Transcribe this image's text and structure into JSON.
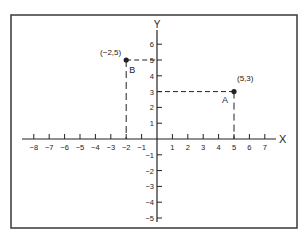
{
  "figure": {
    "axis_labels": {
      "x": "X",
      "y": "Y"
    },
    "x_ticks": [
      -8,
      -7,
      -6,
      -5,
      -4,
      -3,
      -2,
      -1,
      1,
      2,
      3,
      4,
      5,
      6,
      7
    ],
    "y_ticks": [
      6,
      5,
      4,
      3,
      2,
      1,
      -1,
      -2,
      -3,
      -4,
      -5
    ],
    "points": [
      {
        "name": "A",
        "x": 5,
        "y": 3,
        "coord_label": "(5,3)"
      },
      {
        "name": "B",
        "x": -2,
        "y": 5,
        "coord_label": "(−2,5)"
      }
    ],
    "colors": {
      "ink": "#222222",
      "frame": "#444444",
      "background": "#ffffff"
    }
  },
  "chart_data": {
    "type": "scatter",
    "title": "",
    "xlabel": "X",
    "ylabel": "Y",
    "xlim": [
      -8,
      7
    ],
    "ylim": [
      -5,
      6
    ],
    "grid": false,
    "series": [
      {
        "name": "points",
        "x": [
          5,
          -2
        ],
        "y": [
          3,
          5
        ],
        "labels": [
          "A (5,3)",
          "B (-2,5)"
        ]
      }
    ],
    "annotations": [
      "Dashed projection lines from A to x=5 on X axis and y=3 on Y axis",
      "Dashed projection lines from B to x=-2 on X axis and y=5 on Y axis"
    ]
  }
}
